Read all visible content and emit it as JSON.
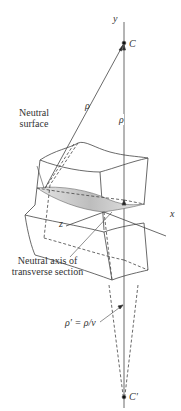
{
  "labels": {
    "y_axis": "y",
    "x_axis": "x",
    "z_axis": "z",
    "center_C": "C",
    "center_C_prime": "C′",
    "rho_left": "ρ",
    "rho_right": "ρ",
    "neutral_surface_line1": "Neutral",
    "neutral_surface_line2": "surface",
    "neutral_axis_line1": "Neutral axis of",
    "neutral_axis_line2": "transverse section",
    "rho_prime_eq": "ρ′ = ρ/ν"
  },
  "colors": {
    "line": "#444444",
    "shade": "#cfcfcf",
    "text": "#333333"
  }
}
